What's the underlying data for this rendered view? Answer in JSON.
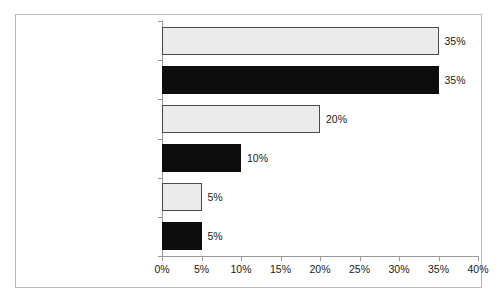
{
  "chart_data": {
    "type": "bar",
    "orientation": "horizontal",
    "title": "",
    "subtitle": "",
    "xlabel": "",
    "ylabel": "",
    "categories": [
      "Standardisierungsdruck",
      "Kunde/Markt",
      "Professionalisierungsdruck",
      "Mitarbeiterinitiative",
      "Top Management",
      "Personalentwickluing"
    ],
    "values": [
      35,
      35,
      20,
      10,
      5,
      5
    ],
    "value_labels": [
      "35%",
      "35%",
      "20%",
      "10%",
      "5%",
      "5%"
    ],
    "bar_styles": [
      "light",
      "dark",
      "light",
      "dark",
      "light",
      "dark"
    ],
    "xlim": [
      0,
      40
    ],
    "xticks": [
      0,
      5,
      10,
      15,
      20,
      25,
      30,
      35,
      40
    ],
    "xtick_labels": [
      "0%",
      "5%",
      "10%",
      "15%",
      "20%",
      "25%",
      "30%",
      "35%",
      "40%"
    ],
    "grid": false,
    "legend": null,
    "colors": {
      "light_bar_fill": "#ebebeb",
      "light_bar_border": "#4a4a4a",
      "dark_bar_fill": "#0d0d0d",
      "axis": "#9a9a9a",
      "frame": "#b9b9b9",
      "text": "#1a1a1a",
      "background": "#ffffff"
    }
  }
}
